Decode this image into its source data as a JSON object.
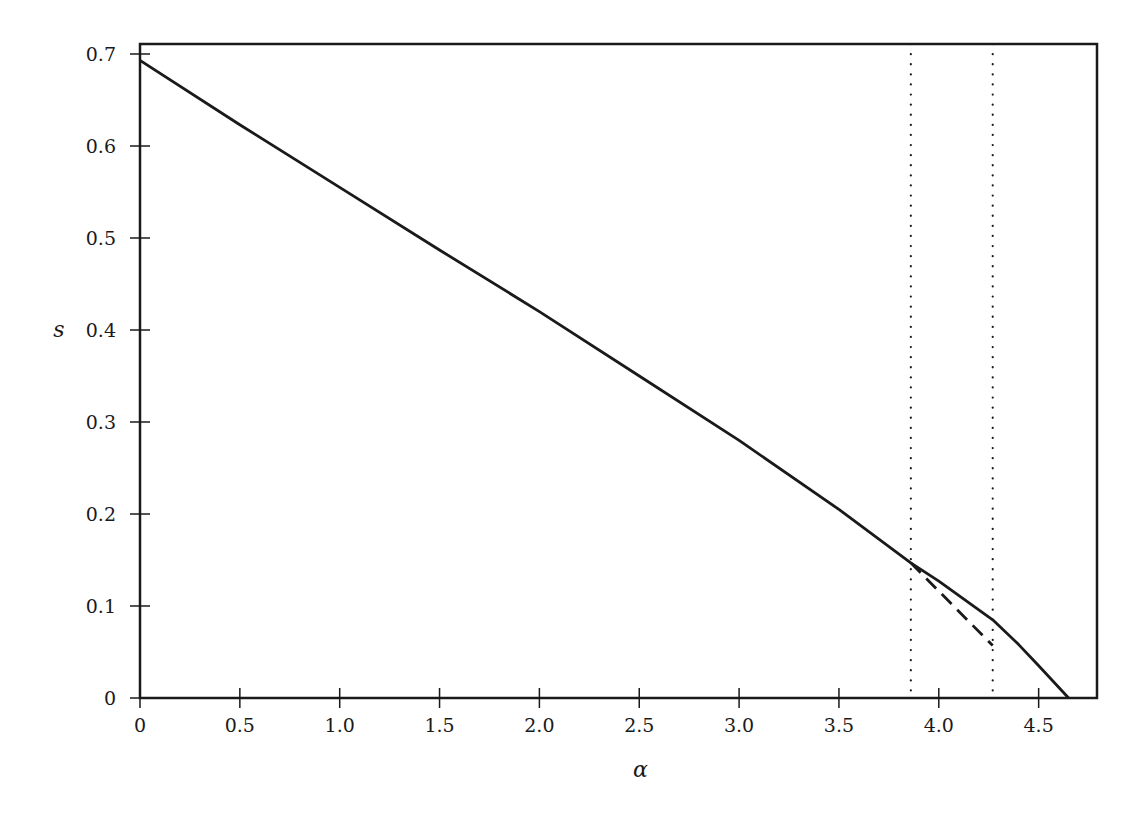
{
  "chart_data": {
    "type": "line",
    "title": "",
    "xlabel": "α",
    "ylabel": "s",
    "xlim": [
      0,
      4.79
    ],
    "ylim": [
      0,
      0.71
    ],
    "grid": false,
    "legend": null,
    "x_ticks": [
      0,
      0.5,
      1.0,
      1.5,
      2.0,
      2.5,
      3.0,
      3.5,
      4.0,
      4.5
    ],
    "x_tick_labels": [
      "0",
      "0.5",
      "1.0",
      "1.5",
      "2.0",
      "2.5",
      "3.0",
      "3.5",
      "4.0",
      "4.5"
    ],
    "y_ticks": [
      0,
      0.1,
      0.2,
      0.3,
      0.4,
      0.5,
      0.6,
      0.7
    ],
    "y_tick_labels": [
      "0",
      "0.1",
      "0.2",
      "0.3",
      "0.4",
      "0.5",
      "0.6",
      "0.7"
    ],
    "series": [
      {
        "name": "solid",
        "style": "solid",
        "x": [
          0,
          0.5,
          1.0,
          1.5,
          2.0,
          2.5,
          3.0,
          3.5,
          3.86,
          4.0,
          4.27,
          4.4,
          4.5,
          4.65
        ],
        "y": [
          0.693,
          0.623,
          0.555,
          0.487,
          0.42,
          0.35,
          0.28,
          0.205,
          0.147,
          0.127,
          0.085,
          0.058,
          0.035,
          0.0
        ]
      },
      {
        "name": "dashed",
        "style": "dashed",
        "x": [
          3.86,
          4.27
        ],
        "y": [
          0.147,
          0.057
        ]
      }
    ],
    "vlines": [
      {
        "x": 3.86,
        "style": "dotted"
      },
      {
        "x": 4.27,
        "style": "dotted"
      }
    ]
  },
  "layout": {
    "plot_left": 140,
    "plot_top": 44,
    "plot_right": 1097,
    "plot_bottom": 698,
    "x_px_per_unit": 199.7,
    "y_px_per_unit": 920
  },
  "colors": {
    "line": "#1a1a1a",
    "background": "#ffffff"
  }
}
